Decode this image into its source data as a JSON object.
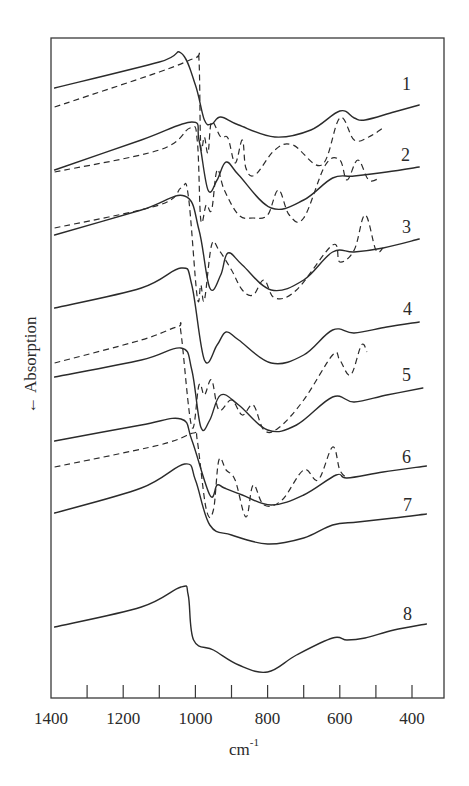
{
  "chart_data": {
    "type": "line",
    "title": "",
    "xlabel": "cm",
    "xlabel_superscript": "-1",
    "ylabel": "Absorption",
    "ylabel_arrow": "←",
    "x_axis": {
      "reversed": true,
      "xlim": [
        1400,
        350
      ],
      "ticks": [
        1400,
        1300,
        1200,
        1100,
        1000,
        900,
        800,
        700,
        600,
        500,
        400
      ],
      "tick_labels": [
        "1400",
        "1200",
        "1000",
        "800",
        "600",
        "400"
      ]
    },
    "grid": false,
    "legend": "inline numeric labels at right end of each trace",
    "series": [
      {
        "name": "1",
        "style": "solid",
        "points": [
          [
            1390,
            88
          ],
          [
            1100,
            62
          ],
          [
            1040,
            53
          ],
          [
            1000,
            85
          ],
          [
            975,
            120
          ],
          [
            955,
            124
          ],
          [
            930,
            117
          ],
          [
            880,
            125
          ],
          [
            780,
            137
          ],
          [
            680,
            130
          ],
          [
            600,
            111
          ],
          [
            560,
            118
          ],
          [
            530,
            120
          ],
          [
            450,
            112
          ],
          [
            380,
            105
          ]
        ]
      },
      {
        "name": "1",
        "style": "dashed",
        "points": [
          [
            1390,
            107
          ],
          [
            1100,
            72
          ],
          [
            1000,
            58
          ],
          [
            990,
            60
          ],
          [
            985,
            146
          ],
          [
            975,
            137
          ],
          [
            965,
            153
          ],
          [
            955,
            122
          ],
          [
            930,
            137
          ],
          [
            910,
            138
          ],
          [
            890,
            163
          ],
          [
            870,
            140
          ],
          [
            860,
            168
          ],
          [
            835,
            175
          ],
          [
            780,
            150
          ],
          [
            730,
            145
          ],
          [
            650,
            165
          ],
          [
            600,
            118
          ],
          [
            560,
            140
          ],
          [
            520,
            137
          ],
          [
            480,
            128
          ]
        ]
      },
      {
        "name": "2",
        "style": "solid",
        "points": [
          [
            1390,
            170
          ],
          [
            1150,
            140
          ],
          [
            1010,
            122
          ],
          [
            990,
            140
          ],
          [
            965,
            190
          ],
          [
            940,
            180
          ],
          [
            915,
            162
          ],
          [
            880,
            175
          ],
          [
            790,
            208
          ],
          [
            700,
            200
          ],
          [
            620,
            178
          ],
          [
            560,
            176
          ],
          [
            470,
            172
          ],
          [
            380,
            167
          ]
        ]
      },
      {
        "name": "2",
        "style": "dashed",
        "points": [
          [
            1390,
            172
          ],
          [
            1100,
            150
          ],
          [
            1015,
            128
          ],
          [
            995,
            140
          ],
          [
            985,
            220
          ],
          [
            970,
            205
          ],
          [
            955,
            210
          ],
          [
            940,
            170
          ],
          [
            920,
            190
          ],
          [
            880,
            215
          ],
          [
            840,
            218
          ],
          [
            800,
            215
          ],
          [
            770,
            190
          ],
          [
            740,
            215
          ],
          [
            700,
            218
          ],
          [
            640,
            165
          ],
          [
            600,
            160
          ],
          [
            580,
            180
          ],
          [
            550,
            160
          ],
          [
            520,
            180
          ],
          [
            490,
            178
          ]
        ]
      },
      {
        "name": "3",
        "style": "solid",
        "points": [
          [
            1390,
            235
          ],
          [
            1150,
            210
          ],
          [
            1030,
            196
          ],
          [
            990,
            230
          ],
          [
            960,
            288
          ],
          [
            930,
            275
          ],
          [
            910,
            253
          ],
          [
            870,
            265
          ],
          [
            790,
            290
          ],
          [
            700,
            280
          ],
          [
            620,
            252
          ],
          [
            560,
            252
          ],
          [
            480,
            248
          ],
          [
            380,
            239
          ]
        ]
      },
      {
        "name": "3",
        "style": "dashed",
        "points": [
          [
            1390,
            228
          ],
          [
            1100,
            205
          ],
          [
            1040,
            188
          ],
          [
            1020,
            195
          ],
          [
            995,
            297
          ],
          [
            985,
            285
          ],
          [
            975,
            300
          ],
          [
            955,
            245
          ],
          [
            935,
            250
          ],
          [
            900,
            270
          ],
          [
            870,
            290
          ],
          [
            840,
            295
          ],
          [
            810,
            280
          ],
          [
            780,
            298
          ],
          [
            720,
            290
          ],
          [
            620,
            245
          ],
          [
            600,
            262
          ],
          [
            560,
            250
          ],
          [
            530,
            215
          ],
          [
            500,
            250
          ],
          [
            480,
            248
          ]
        ]
      },
      {
        "name": "4",
        "style": "solid",
        "points": [
          [
            1390,
            308
          ],
          [
            1150,
            288
          ],
          [
            1040,
            268
          ],
          [
            1010,
            285
          ],
          [
            975,
            360
          ],
          [
            940,
            345
          ],
          [
            915,
            332
          ],
          [
            880,
            340
          ],
          [
            790,
            363
          ],
          [
            700,
            355
          ],
          [
            620,
            330
          ],
          [
            560,
            333
          ],
          [
            470,
            327
          ],
          [
            380,
            322
          ]
        ]
      },
      {
        "name": "5",
        "style": "solid",
        "points": [
          [
            1390,
            377
          ],
          [
            1150,
            360
          ],
          [
            1040,
            348
          ],
          [
            1010,
            370
          ],
          [
            985,
            427
          ],
          [
            960,
            420
          ],
          [
            930,
            395
          ],
          [
            880,
            405
          ],
          [
            800,
            430
          ],
          [
            720,
            425
          ],
          [
            620,
            397
          ],
          [
            560,
            402
          ],
          [
            470,
            395
          ],
          [
            370,
            388
          ]
        ]
      },
      {
        "name": "5",
        "style": "dashed",
        "points": [
          [
            1390,
            363
          ],
          [
            1150,
            340
          ],
          [
            1050,
            327
          ],
          [
            1040,
            333
          ],
          [
            1010,
            427
          ],
          [
            990,
            385
          ],
          [
            975,
            395
          ],
          [
            955,
            380
          ],
          [
            935,
            410
          ],
          [
            900,
            400
          ],
          [
            870,
            415
          ],
          [
            840,
            405
          ],
          [
            810,
            430
          ],
          [
            770,
            428
          ],
          [
            700,
            400
          ],
          [
            620,
            355
          ],
          [
            600,
            360
          ],
          [
            570,
            375
          ],
          [
            540,
            345
          ],
          [
            525,
            352
          ]
        ]
      },
      {
        "name": "6",
        "style": "solid",
        "points": [
          [
            1390,
            441
          ],
          [
            1150,
            425
          ],
          [
            1040,
            419
          ],
          [
            1010,
            440
          ],
          [
            960,
            495
          ],
          [
            940,
            485
          ],
          [
            920,
            488
          ],
          [
            870,
            495
          ],
          [
            790,
            505
          ],
          [
            700,
            495
          ],
          [
            610,
            475
          ],
          [
            580,
            478
          ],
          [
            480,
            472
          ],
          [
            360,
            466
          ]
        ]
      },
      {
        "name": "6",
        "style": "dashed",
        "points": [
          [
            1390,
            467
          ],
          [
            1100,
            445
          ],
          [
            1005,
            433
          ],
          [
            995,
            440
          ],
          [
            970,
            509
          ],
          [
            950,
            510
          ],
          [
            935,
            460
          ],
          [
            915,
            470
          ],
          [
            890,
            480
          ],
          [
            860,
            517
          ],
          [
            840,
            485
          ],
          [
            810,
            505
          ],
          [
            760,
            500
          ],
          [
            700,
            470
          ],
          [
            660,
            480
          ],
          [
            620,
            447
          ],
          [
            600,
            470
          ],
          [
            580,
            478
          ]
        ]
      },
      {
        "name": "7",
        "style": "solid",
        "points": [
          [
            1390,
            513
          ],
          [
            1150,
            488
          ],
          [
            1030,
            464
          ],
          [
            1000,
            480
          ],
          [
            960,
            525
          ],
          [
            900,
            535
          ],
          [
            800,
            544
          ],
          [
            700,
            538
          ],
          [
            620,
            525
          ],
          [
            550,
            522
          ],
          [
            450,
            518
          ],
          [
            360,
            514
          ]
        ]
      },
      {
        "name": "8",
        "style": "solid",
        "points": [
          [
            1390,
            627
          ],
          [
            1150,
            607
          ],
          [
            1040,
            587
          ],
          [
            1020,
            595
          ],
          [
            1005,
            640
          ],
          [
            950,
            650
          ],
          [
            880,
            665
          ],
          [
            800,
            672
          ],
          [
            720,
            655
          ],
          [
            620,
            638
          ],
          [
            580,
            640
          ],
          [
            530,
            638
          ],
          [
            450,
            630
          ],
          [
            360,
            624
          ]
        ]
      }
    ],
    "trace_labels": [
      "1",
      "2",
      "3",
      "4",
      "5",
      "6",
      "7",
      "8"
    ]
  }
}
